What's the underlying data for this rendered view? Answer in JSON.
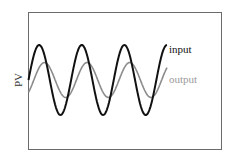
{
  "chart_data": {
    "type": "line",
    "title": "",
    "xlabel": "",
    "ylabel": "PV",
    "grid": false,
    "legend_position": "inline-right",
    "series": [
      {
        "name": "input",
        "color": "#111111",
        "amplitude": 1.0,
        "phase_deg": 0,
        "cycles": 3.25,
        "description": "larger-amplitude sinusoid"
      },
      {
        "name": "output",
        "color": "#8c8c8c",
        "amplitude": 0.5,
        "phase_deg": -45,
        "cycles": 3.25,
        "description": "smaller-amplitude, phase-lagged sinusoid"
      }
    ]
  },
  "labels": {
    "ylabel": "PV",
    "input": "input",
    "output": "output"
  }
}
